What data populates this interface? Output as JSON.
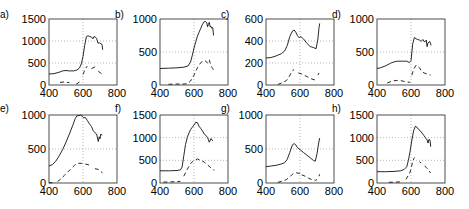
{
  "chart_data": [
    {
      "panel": "a)",
      "type": "line",
      "xlim": [
        400,
        800
      ],
      "ylim": [
        0,
        1500
      ],
      "xticks": [
        400,
        600,
        800
      ],
      "yticks": [
        0,
        500,
        1000,
        1500
      ],
      "xtick_labels": [
        "400",
        "600",
        "800"
      ],
      "ytick_labels": [
        "0",
        "500",
        "1000",
        "1500"
      ],
      "grid": "dotted at x=600 and interior y ticks",
      "series": [
        {
          "name": "solid",
          "style": "solid",
          "x": [
            400,
            430,
            460,
            480,
            500,
            520,
            545,
            565,
            580,
            590,
            600,
            610,
            620,
            630,
            640,
            650,
            658,
            665,
            672,
            680,
            688,
            695,
            705,
            712,
            716
          ],
          "y": [
            250,
            260,
            290,
            320,
            330,
            320,
            320,
            340,
            390,
            480,
            650,
            900,
            1100,
            1120,
            1100,
            1090,
            1050,
            1100,
            1090,
            1060,
            950,
            960,
            940,
            920,
            800
          ]
        },
        {
          "name": "dashed",
          "style": "dashed",
          "x": [
            465,
            490,
            520,
            null,
            560,
            580,
            null,
            600,
            615,
            625,
            null,
            650,
            665,
            675,
            null,
            690,
            705,
            715
          ],
          "y": [
            60,
            70,
            55,
            null,
            15,
            70,
            null,
            240,
            380,
            430,
            null,
            370,
            400,
            420,
            null,
            310,
            270,
            240
          ]
        }
      ]
    },
    {
      "panel": "b)",
      "type": "line",
      "xlim": [
        400,
        800
      ],
      "ylim": [
        0,
        1000
      ],
      "xticks": [
        400,
        600,
        800
      ],
      "yticks": [
        0,
        500,
        1000
      ],
      "xtick_labels": [
        "400",
        "600",
        "800"
      ],
      "ytick_labels": [
        "0",
        "500",
        "1000"
      ],
      "series": [
        {
          "name": "solid",
          "style": "solid",
          "x": [
            400,
            450,
            500,
            540,
            565,
            580,
            590,
            600,
            610,
            620,
            630,
            640,
            650,
            660,
            668,
            675,
            680,
            685,
            690,
            695,
            700,
            705,
            710,
            715
          ],
          "y": [
            250,
            255,
            260,
            270,
            290,
            350,
            450,
            560,
            650,
            740,
            800,
            860,
            920,
            960,
            960,
            940,
            880,
            920,
            950,
            880,
            890,
            860,
            870,
            750
          ]
        },
        {
          "name": "dashed",
          "style": "dashed",
          "x": [
            450,
            500,
            540,
            560,
            580,
            600,
            620,
            640,
            660,
            670,
            680,
            690,
            700,
            710,
            720
          ],
          "y": [
            10,
            15,
            15,
            20,
            60,
            150,
            260,
            340,
            370,
            360,
            330,
            380,
            290,
            250,
            200
          ]
        }
      ]
    },
    {
      "panel": "c)",
      "type": "line",
      "xlim": [
        400,
        800
      ],
      "ylim": [
        0,
        600
      ],
      "xticks": [
        400,
        600,
        800
      ],
      "yticks": [
        0,
        200,
        400,
        600
      ],
      "xtick_labels": [
        "400",
        "600",
        "800"
      ],
      "ytick_labels": [
        "0",
        "200",
        "400",
        "600"
      ],
      "series": [
        {
          "name": "solid",
          "style": "solid",
          "x": [
            400,
            430,
            460,
            490,
            510,
            525,
            540,
            555,
            565,
            575,
            585,
            595,
            605,
            620,
            640,
            660,
            680,
            695,
            705,
            712,
            716
          ],
          "y": [
            245,
            250,
            265,
            285,
            310,
            360,
            440,
            490,
            500,
            480,
            450,
            430,
            440,
            420,
            380,
            350,
            340,
            330,
            420,
            520,
            560
          ]
        },
        {
          "name": "dashed",
          "style": "dashed",
          "x": [
            470,
            500,
            520,
            530,
            545,
            555,
            565,
            null,
            590,
            610,
            630,
            650,
            670,
            690,
            700,
            null,
            705,
            712
          ],
          "y": [
            5,
            25,
            40,
            60,
            100,
            130,
            140,
            null,
            110,
            100,
            85,
            70,
            55,
            45,
            40,
            null,
            90,
            110
          ]
        }
      ]
    },
    {
      "panel": "d)",
      "type": "line",
      "xlim": [
        400,
        800
      ],
      "ylim": [
        0,
        1000
      ],
      "xticks": [
        400,
        600,
        800
      ],
      "yticks": [
        0,
        500,
        1000
      ],
      "xtick_labels": [
        "400",
        "600",
        "800"
      ],
      "ytick_labels": [
        "0",
        "500",
        "1000"
      ],
      "series": [
        {
          "name": "solid",
          "style": "solid",
          "x": [
            400,
            420,
            450,
            480,
            500,
            520,
            550,
            575,
            590,
            600,
            605,
            610,
            620,
            630,
            640,
            650,
            660,
            670,
            680,
            690,
            695,
            700,
            710,
            718
          ],
          "y": [
            250,
            260,
            290,
            330,
            350,
            360,
            360,
            360,
            340,
            370,
            500,
            620,
            720,
            700,
            690,
            680,
            660,
            690,
            650,
            680,
            580,
            640,
            660,
            600
          ]
        },
        {
          "name": "dashed",
          "style": "dashed",
          "x": [
            460,
            490,
            520,
            540,
            560,
            580,
            595,
            null,
            605,
            615,
            630,
            650,
            665,
            680,
            700,
            715
          ],
          "y": [
            30,
            60,
            70,
            65,
            55,
            45,
            40,
            null,
            150,
            240,
            300,
            260,
            200,
            180,
            160,
            150
          ]
        }
      ]
    },
    {
      "panel": "e)",
      "type": "line",
      "xlim": [
        400,
        800
      ],
      "ylim": [
        0,
        1000
      ],
      "xticks": [
        400,
        600,
        800
      ],
      "yticks": [
        0,
        500,
        1000
      ],
      "xtick_labels": [
        "400",
        "600",
        "800"
      ],
      "ytick_labels": [
        "0",
        "500",
        "1000"
      ],
      "series": [
        {
          "name": "solid",
          "style": "solid",
          "x": [
            400,
            420,
            440,
            460,
            480,
            500,
            520,
            540,
            555,
            565,
            575,
            585,
            595,
            605,
            615,
            625,
            635,
            650,
            660,
            670,
            680,
            690,
            695,
            700,
            705,
            712
          ],
          "y": [
            250,
            270,
            320,
            400,
            490,
            600,
            720,
            850,
            950,
            990,
            990,
            1000,
            980,
            960,
            960,
            920,
            880,
            830,
            770,
            740,
            720,
            610,
            680,
            650,
            720,
            700
          ]
        },
        {
          "name": "dashed",
          "style": "dashed",
          "x": [
            400,
            420,
            null,
            450,
            470,
            490,
            510,
            530,
            550,
            570,
            590,
            610,
            630,
            650,
            null,
            670,
            690,
            700,
            715
          ],
          "y": [
            3,
            5,
            null,
            20,
            60,
            110,
            160,
            210,
            260,
            290,
            290,
            280,
            270,
            240,
            null,
            210,
            200,
            180,
            150
          ]
        }
      ]
    },
    {
      "panel": "f)",
      "type": "line",
      "xlim": [
        400,
        800
      ],
      "ylim": [
        0,
        1500
      ],
      "xticks": [
        400,
        600,
        800
      ],
      "yticks": [
        0,
        500,
        1000,
        1500
      ],
      "xtick_labels": [
        "400",
        "600",
        "800"
      ],
      "ytick_labels": [
        "0",
        "500",
        "1000",
        "1500"
      ],
      "series": [
        {
          "name": "solid",
          "style": "solid",
          "x": [
            400,
            450,
            500,
            520,
            530,
            540,
            550,
            560,
            570,
            580,
            590,
            600,
            610,
            620,
            630,
            640,
            650,
            660,
            670,
            680,
            690,
            700,
            710
          ],
          "y": [
            270,
            270,
            275,
            290,
            350,
            600,
            850,
            1000,
            1100,
            1180,
            1230,
            1280,
            1340,
            1330,
            1250,
            1200,
            1150,
            1080,
            1050,
            1000,
            900,
            980,
            930
          ]
        },
        {
          "name": "dashed",
          "style": "dashed",
          "x": [
            420,
            460,
            500,
            520,
            null,
            540,
            560,
            580,
            600,
            620,
            640,
            660,
            680,
            700,
            720
          ],
          "y": [
            20,
            25,
            30,
            35,
            null,
            150,
            300,
            430,
            500,
            530,
            500,
            460,
            400,
            330,
            280
          ]
        }
      ]
    },
    {
      "panel": "g)",
      "type": "line",
      "xlim": [
        400,
        800
      ],
      "ylim": [
        0,
        1000
      ],
      "xticks": [
        400,
        600,
        800
      ],
      "yticks": [
        0,
        500,
        1000
      ],
      "xtick_labels": [
        "400",
        "600",
        "800"
      ],
      "ytick_labels": [
        "0",
        "500",
        "1000"
      ],
      "series": [
        {
          "name": "solid",
          "style": "solid",
          "x": [
            400,
            430,
            460,
            490,
            510,
            525,
            540,
            555,
            565,
            575,
            585,
            600,
            620,
            640,
            660,
            680,
            690,
            700,
            710,
            716
          ],
          "y": [
            240,
            250,
            260,
            280,
            300,
            350,
            450,
            560,
            580,
            560,
            520,
            490,
            450,
            410,
            370,
            330,
            320,
            430,
            590,
            660
          ]
        },
        {
          "name": "dashed",
          "style": "dashed",
          "x": [
            470,
            500,
            520,
            540,
            560,
            580,
            600,
            null,
            610,
            630,
            650,
            670,
            690,
            700,
            null,
            712,
            716
          ],
          "y": [
            10,
            30,
            50,
            90,
            140,
            150,
            140,
            null,
            120,
            100,
            70,
            50,
            40,
            50,
            null,
            100,
            130
          ]
        }
      ]
    },
    {
      "panel": "h)",
      "type": "line",
      "xlim": [
        400,
        800
      ],
      "ylim": [
        0,
        1500
      ],
      "xticks": [
        400,
        600,
        800
      ],
      "yticks": [
        0,
        500,
        1000,
        1500
      ],
      "xtick_labels": [
        "400",
        "600",
        "800"
      ],
      "ytick_labels": [
        "0",
        "500",
        "1000",
        "1500"
      ],
      "series": [
        {
          "name": "solid",
          "style": "solid",
          "x": [
            400,
            450,
            500,
            540,
            560,
            575,
            585,
            595,
            605,
            615,
            625,
            635,
            645,
            655,
            665,
            675,
            685,
            695,
            700,
            705,
            712,
            716
          ],
          "y": [
            250,
            250,
            255,
            270,
            300,
            360,
            500,
            700,
            950,
            1150,
            1250,
            1230,
            1180,
            1150,
            1100,
            1050,
            1000,
            950,
            880,
            960,
            950,
            800
          ]
        },
        {
          "name": "dashed",
          "style": "dashed",
          "x": [
            470,
            510,
            540,
            null,
            570,
            590,
            600,
            610,
            620,
            null,
            650,
            660,
            null,
            680,
            700,
            715
          ],
          "y": [
            15,
            20,
            25,
            null,
            80,
            200,
            300,
            480,
            560,
            null,
            470,
            440,
            null,
            380,
            300,
            220
          ]
        }
      ]
    }
  ]
}
